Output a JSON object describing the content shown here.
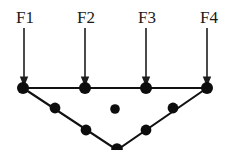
{
  "figure": {
    "background_color": "#ffffff",
    "ink_color": "#111111",
    "label_color": "#1a1a1a",
    "width": 231,
    "height": 150
  },
  "force_labels": [
    {
      "id": "F1",
      "text": "F1",
      "x": 25,
      "y": 23
    },
    {
      "id": "F2",
      "text": "F2",
      "x": 86,
      "y": 23
    },
    {
      "id": "F3",
      "text": "F3",
      "x": 147,
      "y": 23
    },
    {
      "id": "F4",
      "text": "F4",
      "x": 209,
      "y": 23
    }
  ],
  "arrows": [
    {
      "id": "arrow-f1",
      "x": 24,
      "y_start": 28,
      "y_end": 87,
      "direction": "down"
    },
    {
      "id": "arrow-f2",
      "x": 85,
      "y_start": 28,
      "y_end": 87,
      "direction": "down"
    },
    {
      "id": "arrow-f3",
      "x": 146,
      "y_start": 28,
      "y_end": 87,
      "direction": "down"
    },
    {
      "id": "arrow-f4",
      "x": 207,
      "y_start": 28,
      "y_end": 87,
      "direction": "down"
    }
  ],
  "arrow_head": {
    "half_width": 4.2,
    "length": 10.5
  },
  "nodes": [
    {
      "id": "n-top-left",
      "x": 23,
      "y": 88,
      "r": 6.0,
      "on_chord": "top"
    },
    {
      "id": "n-top-mid-left",
      "x": 85,
      "y": 88,
      "r": 6.0,
      "on_chord": "top"
    },
    {
      "id": "n-top-mid-right",
      "x": 146,
      "y": 88,
      "r": 6.0,
      "on_chord": "top"
    },
    {
      "id": "n-top-right",
      "x": 207,
      "y": 88,
      "r": 6.0,
      "on_chord": "top"
    },
    {
      "id": "n-left-diag-1",
      "x": 55,
      "y": 108,
      "r": 5.4,
      "on_chord": "left-diagonal"
    },
    {
      "id": "n-left-diag-2",
      "x": 86,
      "y": 130,
      "r": 5.4,
      "on_chord": "left-diagonal"
    },
    {
      "id": "n-bottom-apex",
      "x": 117,
      "y": 149,
      "r": 5.8,
      "on_chord": "apex"
    },
    {
      "id": "n-right-diag-2",
      "x": 146,
      "y": 130,
      "r": 5.4,
      "on_chord": "right-diagonal"
    },
    {
      "id": "n-right-diag-1",
      "x": 173,
      "y": 108,
      "r": 5.4,
      "on_chord": "right-diagonal"
    },
    {
      "id": "n-center-free",
      "x": 115,
      "y": 109,
      "r": 4.8,
      "on_chord": "none"
    }
  ],
  "members": [
    {
      "id": "member-top-chord",
      "x1": 23,
      "y1": 88,
      "x2": 207,
      "y2": 88
    },
    {
      "id": "member-left-diagonal",
      "x1": 23,
      "y1": 88,
      "x2": 117,
      "y2": 150
    },
    {
      "id": "member-right-diagonal",
      "x1": 117,
      "y1": 150,
      "x2": 207,
      "y2": 88
    }
  ]
}
